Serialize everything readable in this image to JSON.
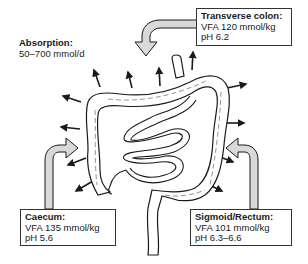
{
  "absorption": {
    "title": "Absorption:",
    "value": "50–700 mmol/d"
  },
  "regions": [
    {
      "name": "Transverse colon:",
      "vfa": "VFA 120 mmol/kg",
      "ph": "pH 6.2"
    },
    {
      "name": "Caecum:",
      "vfa": "VFA 135 mmol/kg",
      "ph": "pH 5.6"
    },
    {
      "name": "Sigmoid/Rectum:",
      "vfa": "VFA 101 mmol/kg",
      "ph": "pH 6.3–6.6"
    }
  ],
  "colors": {
    "outline": "#1a1a1a",
    "arrow_fill": "#d9d9d9",
    "background": "#ffffff"
  }
}
